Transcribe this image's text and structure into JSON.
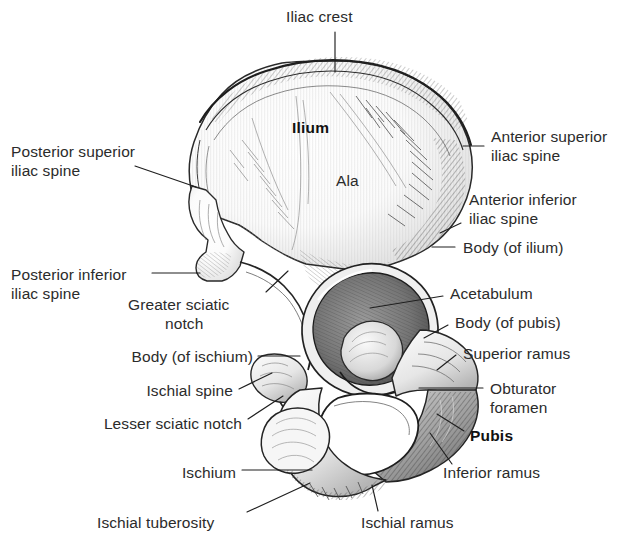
{
  "figure": {
    "style": "pen-and-ink anatomical line drawing with stipple and hatch shading",
    "background_color": "#ffffff",
    "ink_color": "#2b2b2b",
    "bone_fill": "#f4f4f4"
  },
  "labels": [
    {
      "id": "iliac-crest",
      "text": "Iliac crest",
      "bold": false,
      "align": "left",
      "x": 286,
      "y": 8,
      "lines": [
        "Iliac crest"
      ]
    },
    {
      "id": "ilium",
      "text": "Ilium",
      "bold": true,
      "align": "left",
      "x": 292,
      "y": 119,
      "lines": [
        "Ilium"
      ]
    },
    {
      "id": "ala",
      "text": "Ala",
      "bold": false,
      "align": "left",
      "x": 336,
      "y": 172,
      "lines": [
        "Ala"
      ]
    },
    {
      "id": "posterior-superior-iliac-spine",
      "text": "Posterior superior iliac spine",
      "bold": false,
      "align": "left",
      "x": 11,
      "y": 143,
      "lines": [
        "Posterior superior",
        "iliac spine"
      ]
    },
    {
      "id": "anterior-superior-iliac-spine",
      "text": "Anterior superior iliac spine",
      "bold": false,
      "align": "left",
      "x": 491,
      "y": 128,
      "lines": [
        "Anterior superior",
        "iliac spine"
      ]
    },
    {
      "id": "anterior-inferior-iliac-spine",
      "text": "Anterior inferior iliac spine",
      "bold": false,
      "align": "left",
      "x": 469,
      "y": 191,
      "lines": [
        "Anterior inferior",
        "iliac spine"
      ]
    },
    {
      "id": "body-of-ilium",
      "text": "Body (of ilium)",
      "bold": false,
      "align": "left",
      "x": 463,
      "y": 239,
      "lines": [
        "Body (of ilium)"
      ]
    },
    {
      "id": "posterior-inferior-iliac-spine",
      "text": "Posterior inferior iliac spine",
      "bold": false,
      "align": "left",
      "x": 11,
      "y": 266,
      "lines": [
        "Posterior inferior",
        "iliac spine"
      ]
    },
    {
      "id": "acetabulum",
      "text": "Acetabulum",
      "bold": false,
      "align": "left",
      "x": 450,
      "y": 285,
      "lines": [
        "Acetabulum"
      ]
    },
    {
      "id": "greater-sciatic-notch",
      "text": "Greater sciatic notch",
      "bold": false,
      "align": "left",
      "x": 128,
      "y": 296,
      "lines": [
        "Greater sciatic",
        "notch"
      ]
    },
    {
      "id": "body-of-pubis",
      "text": "Body (of pubis)",
      "bold": false,
      "align": "left",
      "x": 455,
      "y": 314,
      "lines": [
        "Body (of pubis)"
      ]
    },
    {
      "id": "body-of-ischium",
      "text": "Body (of ischium)",
      "bold": false,
      "align": "right",
      "x": 253,
      "y": 348,
      "lines": [
        "Body (of ischium)"
      ]
    },
    {
      "id": "superior-ramus",
      "text": "Superior ramus",
      "bold": false,
      "align": "left",
      "x": 463,
      "y": 345,
      "lines": [
        "Superior ramus"
      ]
    },
    {
      "id": "ischial-spine",
      "text": "Ischial spine",
      "bold": false,
      "align": "right",
      "x": 233,
      "y": 382,
      "lines": [
        "Ischial spine"
      ]
    },
    {
      "id": "obturator-foramen",
      "text": "Obturator foramen",
      "bold": false,
      "align": "left",
      "x": 490,
      "y": 380,
      "lines": [
        "Obturator",
        "foramen"
      ]
    },
    {
      "id": "lesser-sciatic-notch",
      "text": "Lesser sciatic notch",
      "bold": false,
      "align": "right",
      "x": 242,
      "y": 415,
      "lines": [
        "Lesser sciatic notch"
      ]
    },
    {
      "id": "pubis",
      "text": "Pubis",
      "bold": true,
      "align": "left",
      "x": 470,
      "y": 427,
      "lines": [
        "Pubis"
      ]
    },
    {
      "id": "inferior-ramus",
      "text": "Inferior ramus",
      "bold": false,
      "align": "left",
      "x": 443,
      "y": 464,
      "lines": [
        "Inferior ramus"
      ]
    },
    {
      "id": "ischium",
      "text": "Ischium",
      "bold": false,
      "align": "right",
      "x": 236,
      "y": 464,
      "lines": [
        "Ischium"
      ]
    },
    {
      "id": "ischial-tuberosity",
      "text": "Ischial tuberosity",
      "bold": false,
      "align": "left",
      "x": 97,
      "y": 514,
      "lines": [
        "Ischial tuberosity"
      ]
    },
    {
      "id": "ischial-ramus",
      "text": "Ischial ramus",
      "bold": false,
      "align": "left",
      "x": 361,
      "y": 514,
      "lines": [
        "Ischial ramus"
      ]
    }
  ],
  "leader_lines": [
    {
      "id": "leader-iliac-crest",
      "from": [
        335,
        32
      ],
      "to": [
        335,
        72
      ]
    },
    {
      "id": "leader-posterior-superior-iliac-spine",
      "from": [
        135,
        166
      ],
      "to": [
        196,
        187
      ]
    },
    {
      "id": "leader-anterior-superior-iliac-spine",
      "from": [
        484,
        146
      ],
      "to": [
        463,
        146
      ]
    },
    {
      "id": "leader-anterior-inferior-iliac-spine",
      "from": [
        461,
        223
      ],
      "to": [
        440,
        233
      ]
    },
    {
      "id": "leader-body-of-ilium",
      "from": [
        455,
        247
      ],
      "to": [
        432,
        247
      ]
    },
    {
      "id": "leader-posterior-inferior-iliac-spine",
      "from": [
        152,
        273
      ],
      "to": [
        200,
        273
      ]
    },
    {
      "id": "leader-acetabulum",
      "from": [
        443,
        296
      ],
      "to": [
        370,
        308
      ]
    },
    {
      "id": "leader-greater-sciatic-notch",
      "from": [
        266,
        292
      ],
      "to": [
        288,
        271
      ]
    },
    {
      "id": "leader-body-of-pubis",
      "from": [
        448,
        325
      ],
      "to": [
        424,
        338
      ]
    },
    {
      "id": "leader-body-of-ischium",
      "from": [
        258,
        356
      ],
      "to": [
        300,
        356
      ]
    },
    {
      "id": "leader-superior-ramus",
      "from": [
        456,
        355
      ],
      "to": [
        437,
        370
      ]
    },
    {
      "id": "leader-ischial-spine",
      "from": [
        239,
        389
      ],
      "to": [
        272,
        373
      ]
    },
    {
      "id": "leader-obturator-foramen",
      "from": [
        483,
        388
      ],
      "to": [
        419,
        388
      ]
    },
    {
      "id": "leader-lesser-sciatic-notch",
      "from": [
        248,
        419
      ],
      "to": [
        283,
        396
      ]
    },
    {
      "id": "leader-pubis",
      "from": [
        464,
        431
      ],
      "to": [
        437,
        414
      ]
    },
    {
      "id": "leader-inferior-ramus",
      "from": [
        452,
        464
      ],
      "to": [
        430,
        433
      ]
    },
    {
      "id": "leader-ischium",
      "from": [
        242,
        470
      ],
      "to": [
        312,
        470
      ]
    },
    {
      "id": "leader-ischial-tuberosity",
      "from": [
        247,
        512
      ],
      "to": [
        310,
        483
      ]
    },
    {
      "id": "leader-ischial-ramus",
      "from": [
        378,
        511
      ],
      "to": [
        372,
        485
      ]
    }
  ]
}
